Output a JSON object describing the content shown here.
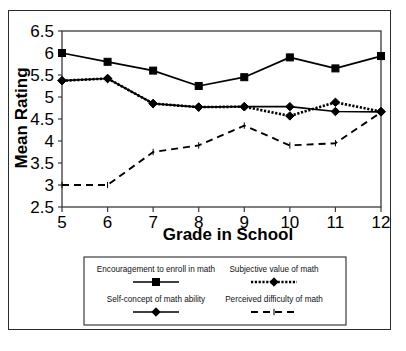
{
  "figure": {
    "background_color": "#ffffff",
    "frame_color": "#2b2b2b",
    "series_color": "#000000"
  },
  "chart_data": {
    "type": "line",
    "title": "",
    "xlabel": "Grade in School",
    "ylabel": "Mean Rating",
    "categories": [
      5,
      6,
      7,
      8,
      9,
      10,
      11,
      12
    ],
    "x": [
      5,
      6,
      7,
      8,
      9,
      10,
      11,
      12
    ],
    "xlim": [
      5,
      12
    ],
    "ylim": [
      2.5,
      6.5
    ],
    "yticks": [
      "2.5",
      "3",
      "3.5",
      "4",
      "4.5",
      "5",
      "5.5",
      "6",
      "6.5"
    ],
    "ytick_values": [
      2.5,
      3,
      3.5,
      4,
      4.5,
      5,
      5.5,
      6,
      6.5
    ],
    "xticks": [
      "5",
      "6",
      "7",
      "8",
      "9",
      "10",
      "11",
      "12"
    ],
    "grid": false,
    "legend_position": "below",
    "series": [
      {
        "name": "Encouragement to enroll in math",
        "marker": "square",
        "line_style": "solid",
        "values": [
          6.0,
          5.8,
          5.6,
          5.25,
          5.45,
          5.9,
          5.65,
          5.93
        ]
      },
      {
        "name": "Subjective value of math",
        "marker": "diamond",
        "line_style": "dotted",
        "values": [
          5.37,
          5.42,
          4.85,
          4.77,
          4.78,
          4.57,
          4.88,
          4.67
        ]
      },
      {
        "name": "Self-concept of math ability",
        "marker": "diamond",
        "line_style": "solid",
        "values": [
          5.37,
          5.42,
          4.85,
          4.77,
          4.78,
          4.78,
          4.67,
          4.66
        ]
      },
      {
        "name": "Perceived difficulty of math",
        "marker": "none",
        "line_style": "dashed",
        "values": [
          3.0,
          3.0,
          3.75,
          3.9,
          4.35,
          3.9,
          3.95,
          4.65
        ]
      }
    ]
  },
  "legend": {
    "entries": [
      {
        "label": "Encouragement to enroll in math",
        "swatch": "solid-square"
      },
      {
        "label": "Subjective value of math",
        "swatch": "dotted-diamond"
      },
      {
        "label": "Self-concept of math ability",
        "swatch": "solid-diamond"
      },
      {
        "label": "Perceived difficulty of math",
        "swatch": "dashed-plain"
      }
    ]
  }
}
